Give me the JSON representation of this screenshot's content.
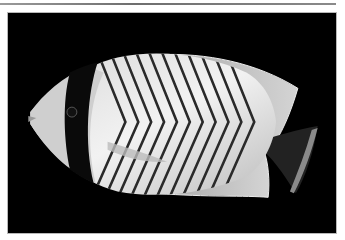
{
  "image": {
    "alt": "Chevron butterflyfish photographed against a black background",
    "subject": "butterflyfish",
    "background_color": "#000000",
    "frame_border_color": "#b8b8b8",
    "rule_color": "#7a7a7a"
  }
}
